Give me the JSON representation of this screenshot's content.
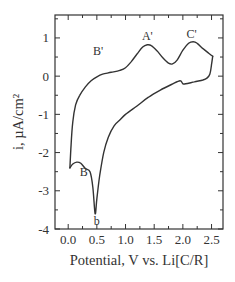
{
  "chart_data": {
    "type": "line",
    "title": "",
    "xlabel": "Potential, V vs. Li[C/R]",
    "ylabel": "i, µA/cm²",
    "xlim": [
      -0.23,
      2.7
    ],
    "ylim": [
      -4,
      1.6
    ],
    "xticks": [
      0.0,
      0.5,
      1.0,
      1.5,
      2.0,
      2.5
    ],
    "xtick_labels": [
      "0.0",
      "0.5",
      "1.0",
      "1.5",
      "2.0",
      "2.5"
    ],
    "yticks": [
      -4,
      -3,
      -2,
      -1,
      0,
      1
    ],
    "ytick_labels": [
      "-4",
      "-3",
      "-2",
      "-1",
      "0",
      "1"
    ],
    "grid": false,
    "legend": null,
    "series": [
      {
        "name": "Cyclic voltammogram (anodic sweep)",
        "x": [
          0.03,
          0.05,
          0.08,
          0.13,
          0.2,
          0.3,
          0.4,
          0.5,
          0.6,
          0.75,
          0.9,
          1.0,
          1.1,
          1.2,
          1.3,
          1.38,
          1.45,
          1.55,
          1.65,
          1.75,
          1.82,
          1.9,
          2.0,
          2.1,
          2.18,
          2.25,
          2.35,
          2.45,
          2.52
        ],
        "y": [
          -2.4,
          -1.8,
          -1.2,
          -0.75,
          -0.5,
          -0.28,
          -0.12,
          -0.02,
          0.05,
          0.1,
          0.15,
          0.22,
          0.38,
          0.58,
          0.76,
          0.82,
          0.8,
          0.66,
          0.48,
          0.34,
          0.32,
          0.42,
          0.68,
          0.86,
          0.9,
          0.86,
          0.72,
          0.6,
          0.52
        ]
      },
      {
        "name": "Cyclic voltammogram (cathodic sweep)",
        "x": [
          2.52,
          2.5,
          2.47,
          2.42,
          2.35,
          2.2,
          2.05,
          2.0,
          1.95,
          1.8,
          1.6,
          1.4,
          1.2,
          1.0,
          0.9,
          0.8,
          0.7,
          0.62,
          0.55,
          0.5,
          0.47,
          0.43,
          0.38,
          0.3,
          0.22,
          0.15,
          0.08,
          0.03
        ],
        "y": [
          0.52,
          0.3,
          0.05,
          -0.05,
          -0.1,
          -0.15,
          -0.2,
          -0.2,
          -0.12,
          -0.22,
          -0.37,
          -0.55,
          -0.78,
          -1.0,
          -1.15,
          -1.3,
          -1.6,
          -2.0,
          -2.6,
          -3.2,
          -3.6,
          -2.9,
          -2.5,
          -2.42,
          -2.28,
          -2.25,
          -2.3,
          -2.4
        ]
      }
    ],
    "annotations": [
      {
        "text": "A'",
        "x": 1.38,
        "y": 0.95
      },
      {
        "text": "C'",
        "x": 2.15,
        "y": 1.0
      },
      {
        "text": "B'",
        "x": 0.52,
        "y": 0.55
      },
      {
        "text": "B",
        "x": 0.27,
        "y": -2.6
      },
      {
        "text": "b",
        "x": 0.5,
        "y": -3.9
      }
    ]
  },
  "labels": {
    "xlabel": "Potential, V vs. Li[C/R]",
    "ylabel": "i, µA/cm²"
  }
}
